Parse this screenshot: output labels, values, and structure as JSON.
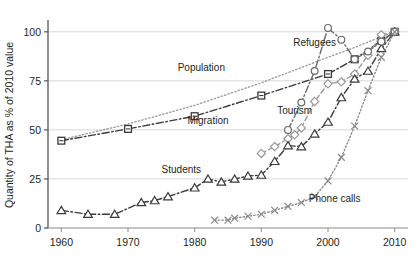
{
  "chart_data": {
    "type": "line",
    "title": "",
    "xlabel": "",
    "ylabel": "Quantity of THA as % of 2010 value",
    "xlim": [
      1958,
      2012
    ],
    "ylim": [
      0,
      105
    ],
    "xticks": [
      1960,
      1970,
      1980,
      1990,
      2000,
      2010
    ],
    "xtick_labels": [
      "1960",
      "1970",
      "1980",
      "1990",
      "2000",
      "2010"
    ],
    "yticks": [
      0,
      25,
      50,
      75,
      100
    ],
    "ytick_labels": [
      "0",
      "25",
      "50",
      "75",
      "100"
    ],
    "grid": "horizontal",
    "legend_position": "inline-annotations",
    "series": [
      {
        "name": "Population",
        "label": "Population",
        "marker": "none",
        "linestyle": "dotted",
        "color": "#9a9a9a",
        "label_x": 1981,
        "label_y": 80,
        "x": [
          1960,
          1970,
          1980,
          1990,
          2000,
          2004,
          2008,
          2010
        ],
        "y": [
          45.0,
          53.0,
          62.5,
          74.0,
          87.0,
          92.0,
          97.5,
          100.0
        ]
      },
      {
        "name": "Migration",
        "label": "Migration",
        "marker": "square",
        "linestyle": "dash-dot",
        "color": "#3a3a3a",
        "label_x": 1982,
        "label_y": 53,
        "x": [
          1960,
          1970,
          1980,
          1990,
          2000,
          2004,
          2008,
          2010
        ],
        "y": [
          44.5,
          50.5,
          57.0,
          67.5,
          78.5,
          86.0,
          95.5,
          100.0
        ]
      },
      {
        "name": "Tourism",
        "label": "Tourism",
        "marker": "diamond",
        "linestyle": "dashed",
        "color": "#9a9a9a",
        "label_x": 1995,
        "label_y": 58,
        "x": [
          1990,
          1992,
          1994,
          1995,
          1996,
          1998,
          2000,
          2002,
          2004,
          2006,
          2008,
          2010
        ],
        "y": [
          38.0,
          41.5,
          45.5,
          47.5,
          51.0,
          64.5,
          73.5,
          74.5,
          78.5,
          88.0,
          98.5,
          100.0
        ]
      },
      {
        "name": "Students",
        "label": "Students",
        "marker": "triangle",
        "linestyle": "dash-dot",
        "color": "#3a3a3a",
        "label_x": 1978,
        "label_y": 28,
        "x": [
          1960,
          1964,
          1968,
          1972,
          1974,
          1976,
          1980,
          1982,
          1984,
          1986,
          1988,
          1990,
          1992,
          1994,
          1996,
          1998,
          2000,
          2002,
          2004,
          2006,
          2008,
          2010
        ],
        "y": [
          9.0,
          7.0,
          7.0,
          13.0,
          14.0,
          16.0,
          20.5,
          25.0,
          23.5,
          25.0,
          26.5,
          27.0,
          34.0,
          42.0,
          41.5,
          48.0,
          54.0,
          66.5,
          76.0,
          80.0,
          91.5,
          100.0
        ]
      },
      {
        "name": "Refugees",
        "label": "Refugees",
        "marker": "circle",
        "linestyle": "dash-dot",
        "color": "#6a6a6a",
        "label_x": 1998,
        "label_y": 93,
        "x": [
          1994,
          1996,
          1998,
          2000,
          2002,
          2004,
          2006,
          2008,
          2010
        ],
        "y": [
          50.0,
          64.0,
          80.0,
          102.0,
          96.0,
          86.0,
          90.0,
          95.0,
          100.0
        ]
      },
      {
        "name": "Phone calls",
        "label": "Phone calls",
        "marker": "x",
        "linestyle": "dotted",
        "color": "#8a8a8a",
        "label_x": 2001,
        "label_y": 13,
        "x": [
          1983,
          1985,
          1986,
          1988,
          1990,
          1992,
          1994,
          1996,
          1998,
          2000,
          2002,
          2004,
          2006,
          2008,
          2010
        ],
        "y": [
          4.0,
          4.0,
          5.0,
          6.0,
          7.0,
          9.0,
          11.0,
          13.0,
          16.0,
          24.0,
          36.0,
          52.0,
          70.0,
          87.0,
          100.0
        ]
      }
    ]
  },
  "axis": {
    "y_title": "Quantity of THA as % of 2010 value"
  }
}
